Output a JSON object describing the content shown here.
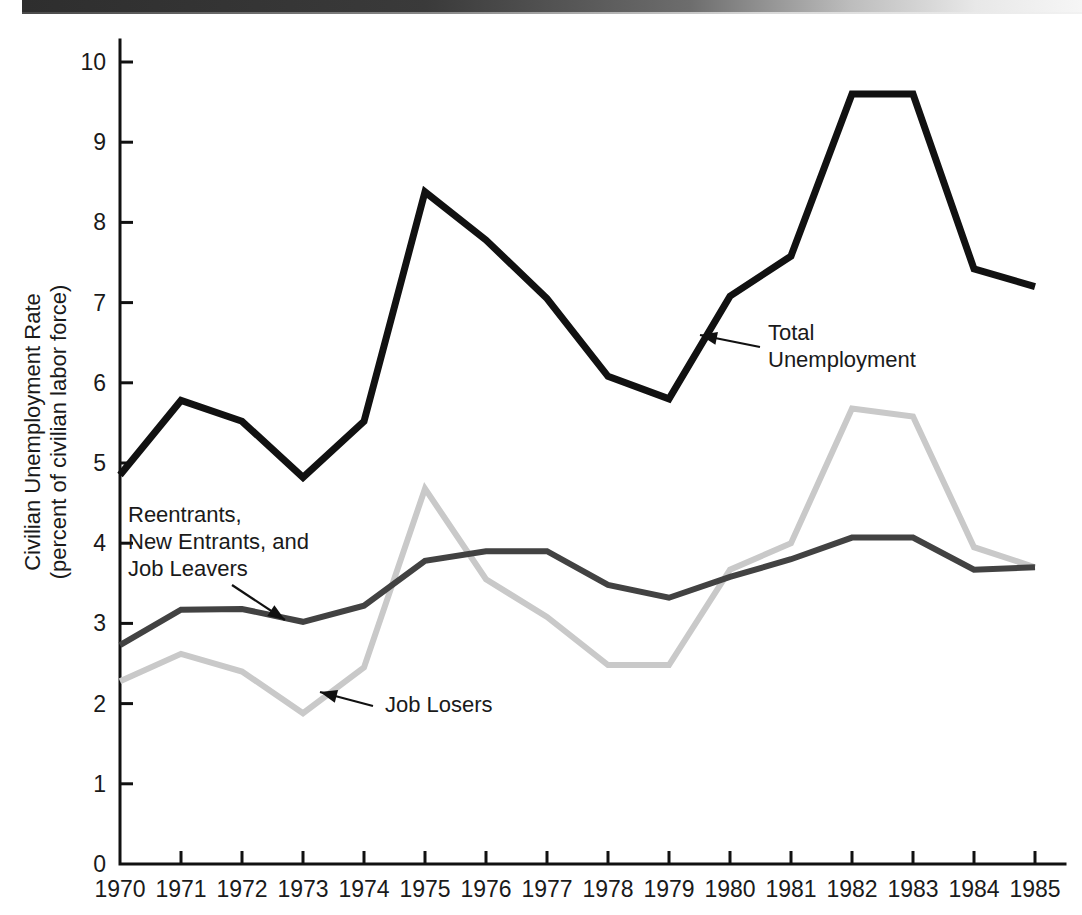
{
  "figure": {
    "background_color": "#ffffff",
    "scan_artifact": "top-dark-band"
  },
  "chart_data": {
    "type": "line",
    "title": "",
    "xlabel": "",
    "ylabel": "Civilian Unemployment Rate",
    "ylabel_line2": "(percent of civilian labor force)",
    "grid": false,
    "legend_position": "inline-annotations",
    "xlim": [
      1970,
      1985
    ],
    "ylim": [
      0,
      10.6
    ],
    "yticks": [
      0,
      1,
      2,
      3,
      4,
      5,
      6,
      7,
      8,
      9,
      10
    ],
    "ytick_labels": [
      "0",
      "1",
      "2",
      "3",
      "4",
      "5",
      "6",
      "7",
      "8",
      "9",
      "10"
    ],
    "categories": [
      1970,
      1971,
      1972,
      1973,
      1974,
      1975,
      1976,
      1977,
      1978,
      1979,
      1980,
      1981,
      1982,
      1983,
      1984,
      1985
    ],
    "xtick_labels": [
      "1970",
      "1971",
      "1972",
      "1973",
      "1974",
      "1975",
      "1976",
      "1977",
      "1978",
      "1979",
      "1980",
      "1981",
      "1982",
      "1983",
      "1984",
      "1985"
    ],
    "series": [
      {
        "name": "Total Unemployment",
        "color": "#111111",
        "stroke_width": 7,
        "values": [
          4.85,
          5.78,
          5.52,
          4.82,
          5.52,
          8.38,
          7.78,
          7.05,
          6.08,
          5.8,
          7.08,
          7.58,
          9.6,
          9.6,
          7.42,
          7.2
        ]
      },
      {
        "name": "Reentrants, New Entrants, and Job Leavers",
        "color": "#424242",
        "stroke_width": 6,
        "values": [
          2.73,
          3.17,
          3.18,
          3.02,
          3.22,
          3.78,
          3.9,
          3.9,
          3.48,
          3.32,
          3.58,
          3.8,
          4.07,
          4.07,
          3.67,
          3.7
        ]
      },
      {
        "name": "Job Losers",
        "color": "#c9c9c9",
        "stroke_width": 6,
        "values": [
          2.28,
          2.62,
          2.4,
          1.88,
          2.45,
          4.68,
          3.55,
          3.08,
          2.48,
          2.48,
          3.67,
          4.0,
          5.68,
          5.58,
          3.95,
          3.7
        ]
      }
    ],
    "annotations": [
      {
        "id": "total-unemployment",
        "lines": [
          "Total",
          "Unemployment"
        ],
        "text_x": 768,
        "text_y": 340,
        "arrow_from": [
          760,
          347
        ],
        "arrow_to": [
          700,
          335
        ]
      },
      {
        "id": "reentrants-new-entrants-job-leavers",
        "lines": [
          "Reentrants,",
          "New Entrants, and",
          "Job Leavers"
        ],
        "text_x": 128,
        "text_y": 522,
        "arrow_from": [
          232,
          585
        ],
        "arrow_to": [
          285,
          620
        ]
      },
      {
        "id": "job-losers",
        "lines": [
          "Job Losers"
        ],
        "text_x": 385,
        "text_y": 712,
        "arrow_from": [
          373,
          706
        ],
        "arrow_to": [
          320,
          692
        ]
      }
    ]
  }
}
